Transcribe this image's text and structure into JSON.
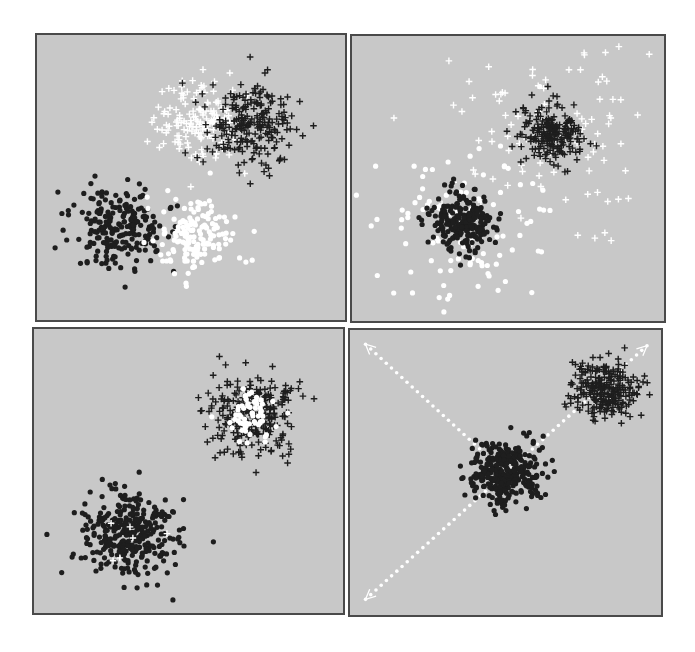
{
  "figure": {
    "background": "#ffffff",
    "panel_background": "#c8c8c8",
    "panel_border": "#4a4a4a",
    "point_dark": "#1e1e1e",
    "point_light": "#ffffff"
  },
  "chart_data": [
    {
      "type": "scatter",
      "panel": "top-left",
      "title": "",
      "xlabel": "",
      "ylabel": "",
      "grid": false,
      "legend": "none",
      "box": {
        "left": 35,
        "top": 33,
        "width": 312,
        "height": 289
      },
      "series": [
        {
          "name": "cluster A (dots, black)",
          "marker": "dot",
          "color": "#1e1e1e",
          "center": [
            0.27,
            0.68
          ],
          "sd": [
            0.075,
            0.075
          ],
          "n": 220,
          "seed": 11
        },
        {
          "name": "cluster A' (dots, white)",
          "marker": "dot",
          "color": "#ffffff",
          "center": [
            0.52,
            0.7
          ],
          "sd": [
            0.065,
            0.07
          ],
          "n": 150,
          "seed": 12
        },
        {
          "name": "cluster B' (crosses, white)",
          "marker": "cross",
          "color": "#ffffff",
          "center": [
            0.52,
            0.3
          ],
          "sd": [
            0.07,
            0.07
          ],
          "n": 150,
          "seed": 13
        },
        {
          "name": "cluster B (crosses, black)",
          "marker": "cross",
          "color": "#1e1e1e",
          "center": [
            0.7,
            0.32
          ],
          "sd": [
            0.075,
            0.075
          ],
          "n": 230,
          "seed": 14
        }
      ]
    },
    {
      "type": "scatter",
      "panel": "top-right",
      "title": "",
      "xlabel": "",
      "ylabel": "",
      "grid": false,
      "legend": "none",
      "box": {
        "left": 350,
        "top": 34,
        "width": 316,
        "height": 289
      },
      "series": [
        {
          "name": "cluster A' (dots, white, wide)",
          "marker": "dot",
          "color": "#ffffff",
          "center": [
            0.36,
            0.64
          ],
          "sd": [
            0.17,
            0.15
          ],
          "n": 110,
          "seed": 21
        },
        {
          "name": "cluster B' (crosses, white, wide)",
          "marker": "cross",
          "color": "#ffffff",
          "center": [
            0.64,
            0.34
          ],
          "sd": [
            0.17,
            0.15
          ],
          "n": 110,
          "seed": 22
        },
        {
          "name": "cluster A (dots, black)",
          "marker": "dot",
          "color": "#1e1e1e",
          "center": [
            0.35,
            0.65
          ],
          "sd": [
            0.05,
            0.05
          ],
          "n": 230,
          "seed": 23
        },
        {
          "name": "cluster B (crosses, black)",
          "marker": "cross",
          "color": "#1e1e1e",
          "center": [
            0.63,
            0.34
          ],
          "sd": [
            0.05,
            0.055
          ],
          "n": 220,
          "seed": 24
        }
      ]
    },
    {
      "type": "scatter",
      "panel": "bottom-left",
      "title": "",
      "xlabel": "",
      "ylabel": "",
      "grid": false,
      "legend": "none",
      "box": {
        "left": 32,
        "top": 327,
        "width": 313,
        "height": 288
      },
      "series": [
        {
          "name": "cluster B (crosses, black)",
          "marker": "cross",
          "color": "#1e1e1e",
          "center": [
            0.7,
            0.3
          ],
          "sd": [
            0.075,
            0.07
          ],
          "n": 280,
          "seed": 31
        },
        {
          "name": "cluster B' (dots, white)",
          "marker": "dot",
          "color": "#ffffff",
          "center": [
            0.7,
            0.31
          ],
          "sd": [
            0.045,
            0.045
          ],
          "n": 60,
          "seed": 32
        },
        {
          "name": "cluster A (dots, black)",
          "marker": "dot",
          "color": "#1e1e1e",
          "center": [
            0.31,
            0.72
          ],
          "sd": [
            0.075,
            0.07
          ],
          "n": 320,
          "seed": 33
        },
        {
          "name": "cluster A' (crosses, white)",
          "marker": "cross",
          "color": "#ffffff",
          "center": [
            0.31,
            0.72
          ],
          "sd": [
            0.05,
            0.05
          ],
          "n": 6,
          "seed": 34
        }
      ]
    },
    {
      "type": "scatter",
      "panel": "bottom-right",
      "title": "",
      "xlabel": "",
      "ylabel": "",
      "grid": false,
      "legend": "none",
      "box": {
        "left": 348,
        "top": 328,
        "width": 315,
        "height": 289
      },
      "arrows": [
        {
          "from": [
            0.5,
            0.5
          ],
          "to": [
            0.05,
            0.05
          ],
          "color": "#ffffff",
          "style": "dotted"
        },
        {
          "from": [
            0.05,
            0.945
          ],
          "to": [
            0.955,
            0.055
          ],
          "color": "#ffffff",
          "style": "dotted"
        }
      ],
      "series": [
        {
          "name": "cluster A (dots, black)",
          "marker": "dot",
          "color": "#1e1e1e",
          "center": [
            0.5,
            0.5
          ],
          "sd": [
            0.06,
            0.055
          ],
          "n": 340,
          "seed": 41
        },
        {
          "name": "cluster B (crosses, black)",
          "marker": "cross",
          "color": "#1e1e1e",
          "center": [
            0.82,
            0.21
          ],
          "sd": [
            0.055,
            0.055
          ],
          "n": 260,
          "seed": 42
        }
      ]
    }
  ]
}
